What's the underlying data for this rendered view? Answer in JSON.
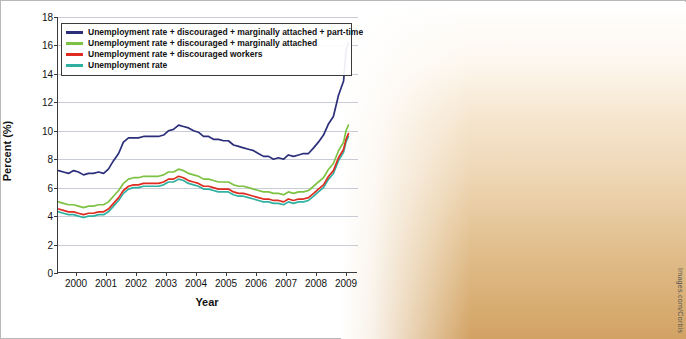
{
  "chart_data": {
    "type": "line",
    "title": "",
    "xlabel": "Year",
    "ylabel": "Percent (%)",
    "ylim": [
      0,
      18
    ],
    "yticks": [
      0,
      2,
      4,
      6,
      8,
      10,
      12,
      14,
      16,
      18
    ],
    "xticks": [
      "2000",
      "2001",
      "2002",
      "2003",
      "2004",
      "2005",
      "2006",
      "2007",
      "2008",
      "2009"
    ],
    "xlim": [
      1999.4,
      2009.4
    ],
    "grid": true,
    "legend_position": "top-left",
    "series": [
      {
        "name": "Unemployment rate + discouraged + marginally attached + part-time",
        "color": "#2b2f7a",
        "x": [
          1999.42,
          1999.58,
          1999.75,
          1999.92,
          2000.08,
          2000.25,
          2000.42,
          2000.58,
          2000.75,
          2000.92,
          2001.08,
          2001.25,
          2001.42,
          2001.58,
          2001.75,
          2001.92,
          2002.08,
          2002.25,
          2002.42,
          2002.58,
          2002.75,
          2002.92,
          2003.08,
          2003.25,
          2003.42,
          2003.58,
          2003.75,
          2003.92,
          2004.08,
          2004.25,
          2004.42,
          2004.58,
          2004.75,
          2004.92,
          2005.08,
          2005.25,
          2005.42,
          2005.58,
          2005.75,
          2005.92,
          2006.08,
          2006.25,
          2006.42,
          2006.58,
          2006.75,
          2006.92,
          2007.08,
          2007.25,
          2007.42,
          2007.58,
          2007.75,
          2007.92,
          2008.08,
          2008.25,
          2008.42,
          2008.58,
          2008.75,
          2008.92,
          2009.0,
          2009.08
        ],
        "y": [
          7.2,
          7.1,
          7.0,
          7.2,
          7.1,
          6.9,
          7.0,
          7.0,
          7.1,
          7.0,
          7.3,
          7.9,
          8.4,
          9.2,
          9.5,
          9.5,
          9.5,
          9.6,
          9.6,
          9.6,
          9.6,
          9.7,
          10.0,
          10.1,
          10.4,
          10.3,
          10.2,
          10.0,
          9.9,
          9.6,
          9.6,
          9.4,
          9.4,
          9.3,
          9.3,
          9.0,
          8.9,
          8.8,
          8.7,
          8.6,
          8.4,
          8.2,
          8.2,
          8.0,
          8.1,
          8.0,
          8.3,
          8.2,
          8.3,
          8.4,
          8.4,
          8.8,
          9.2,
          9.7,
          10.5,
          11.0,
          12.5,
          13.5,
          15.6,
          16.2
        ]
      },
      {
        "name": "Unemployment rate + discouraged + marginally attached",
        "color": "#7dc242",
        "x": [
          1999.42,
          1999.58,
          1999.75,
          1999.92,
          2000.08,
          2000.25,
          2000.42,
          2000.58,
          2000.75,
          2000.92,
          2001.08,
          2001.25,
          2001.42,
          2001.58,
          2001.75,
          2001.92,
          2002.08,
          2002.25,
          2002.42,
          2002.58,
          2002.75,
          2002.92,
          2003.08,
          2003.25,
          2003.42,
          2003.58,
          2003.75,
          2003.92,
          2004.08,
          2004.25,
          2004.42,
          2004.58,
          2004.75,
          2004.92,
          2005.08,
          2005.25,
          2005.42,
          2005.58,
          2005.75,
          2005.92,
          2006.08,
          2006.25,
          2006.42,
          2006.58,
          2006.75,
          2006.92,
          2007.08,
          2007.25,
          2007.42,
          2007.58,
          2007.75,
          2007.92,
          2008.08,
          2008.25,
          2008.42,
          2008.58,
          2008.75,
          2008.92,
          2009.0,
          2009.08
        ],
        "y": [
          5.0,
          4.9,
          4.8,
          4.8,
          4.7,
          4.6,
          4.7,
          4.7,
          4.8,
          4.8,
          5.0,
          5.4,
          5.8,
          6.3,
          6.6,
          6.7,
          6.7,
          6.8,
          6.8,
          6.8,
          6.8,
          6.9,
          7.1,
          7.1,
          7.3,
          7.2,
          7.0,
          6.9,
          6.8,
          6.6,
          6.6,
          6.5,
          6.4,
          6.4,
          6.4,
          6.2,
          6.1,
          6.1,
          6.0,
          5.9,
          5.8,
          5.7,
          5.7,
          5.6,
          5.6,
          5.5,
          5.7,
          5.6,
          5.7,
          5.7,
          5.8,
          6.1,
          6.4,
          6.7,
          7.3,
          7.7,
          8.6,
          9.2,
          10.0,
          10.4
        ]
      },
      {
        "name": "Unemployment rate + discouraged workers",
        "color": "#e02b20",
        "x": [
          1999.42,
          1999.58,
          1999.75,
          1999.92,
          2000.08,
          2000.25,
          2000.42,
          2000.58,
          2000.75,
          2000.92,
          2001.08,
          2001.25,
          2001.42,
          2001.58,
          2001.75,
          2001.92,
          2002.08,
          2002.25,
          2002.42,
          2002.58,
          2002.75,
          2002.92,
          2003.08,
          2003.25,
          2003.42,
          2003.58,
          2003.75,
          2003.92,
          2004.08,
          2004.25,
          2004.42,
          2004.58,
          2004.75,
          2004.92,
          2005.08,
          2005.25,
          2005.42,
          2005.58,
          2005.75,
          2005.92,
          2006.08,
          2006.25,
          2006.42,
          2006.58,
          2006.75,
          2006.92,
          2007.08,
          2007.25,
          2007.42,
          2007.58,
          2007.75,
          2007.92,
          2008.08,
          2008.25,
          2008.42,
          2008.58,
          2008.75,
          2008.92,
          2009.0,
          2009.08
        ],
        "y": [
          4.5,
          4.4,
          4.3,
          4.3,
          4.2,
          4.1,
          4.2,
          4.2,
          4.3,
          4.3,
          4.5,
          4.9,
          5.3,
          5.8,
          6.1,
          6.2,
          6.2,
          6.3,
          6.3,
          6.3,
          6.3,
          6.4,
          6.6,
          6.6,
          6.8,
          6.7,
          6.5,
          6.4,
          6.3,
          6.1,
          6.1,
          6.0,
          5.9,
          5.9,
          5.9,
          5.7,
          5.6,
          5.6,
          5.5,
          5.4,
          5.3,
          5.2,
          5.2,
          5.1,
          5.1,
          5.0,
          5.2,
          5.1,
          5.2,
          5.2,
          5.3,
          5.6,
          5.9,
          6.2,
          6.8,
          7.2,
          8.1,
          8.7,
          9.4,
          9.8
        ]
      },
      {
        "name": "Unemployment rate",
        "color": "#2fb0a0",
        "x": [
          1999.42,
          1999.58,
          1999.75,
          1999.92,
          2000.08,
          2000.25,
          2000.42,
          2000.58,
          2000.75,
          2000.92,
          2001.08,
          2001.25,
          2001.42,
          2001.58,
          2001.75,
          2001.92,
          2002.08,
          2002.25,
          2002.42,
          2002.58,
          2002.75,
          2002.92,
          2003.08,
          2003.25,
          2003.42,
          2003.58,
          2003.75,
          2003.92,
          2004.08,
          2004.25,
          2004.42,
          2004.58,
          2004.75,
          2004.92,
          2005.08,
          2005.25,
          2005.42,
          2005.58,
          2005.75,
          2005.92,
          2006.08,
          2006.25,
          2006.42,
          2006.58,
          2006.75,
          2006.92,
          2007.08,
          2007.25,
          2007.42,
          2007.58,
          2007.75,
          2007.92,
          2008.08,
          2008.25,
          2008.42,
          2008.58,
          2008.75,
          2008.92,
          2009.0,
          2009.08
        ],
        "y": [
          4.3,
          4.2,
          4.1,
          4.1,
          4.0,
          3.9,
          4.0,
          4.0,
          4.1,
          4.1,
          4.3,
          4.7,
          5.1,
          5.6,
          5.9,
          6.0,
          6.0,
          6.1,
          6.1,
          6.1,
          6.1,
          6.2,
          6.4,
          6.4,
          6.6,
          6.5,
          6.3,
          6.2,
          6.1,
          5.9,
          5.9,
          5.8,
          5.7,
          5.7,
          5.7,
          5.5,
          5.4,
          5.4,
          5.3,
          5.2,
          5.1,
          5.0,
          5.0,
          4.9,
          4.9,
          4.8,
          5.0,
          4.9,
          5.0,
          5.0,
          5.1,
          5.4,
          5.7,
          6.0,
          6.6,
          7.0,
          7.9,
          8.5,
          9.2,
          9.6
        ]
      }
    ]
  },
  "legend": {
    "items": [
      {
        "label": "Unemployment rate + discouraged + marginally attached + part-time",
        "color": "#2b2f7a"
      },
      {
        "label": "Unemployment rate + discouraged + marginally attached",
        "color": "#7dc242"
      },
      {
        "label": "Unemployment rate + discouraged workers",
        "color": "#e02b20"
      },
      {
        "label": "Unemployment rate",
        "color": "#2fb0a0"
      }
    ]
  },
  "credit": {
    "text": "Images.com/Corbis"
  }
}
